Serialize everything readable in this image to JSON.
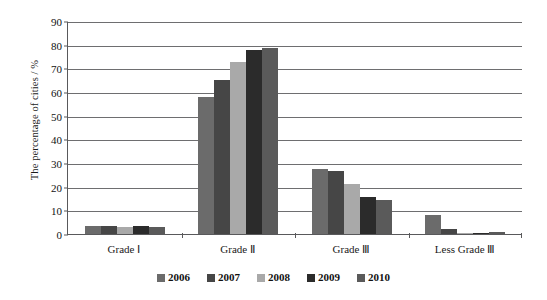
{
  "chart_data": {
    "type": "bar",
    "title": "",
    "subtitle": "",
    "xlabel": "",
    "ylabel": "The percentage of  cities / %",
    "categories": [
      "Grade Ⅰ",
      "Grade Ⅱ",
      "Grade Ⅲ",
      "Less Grade Ⅲ"
    ],
    "ylim": [
      0,
      90
    ],
    "ytick_labels": [
      "0",
      "10",
      "20",
      "30",
      "40",
      "50",
      "60",
      "70",
      "80",
      "90"
    ],
    "yticks": [
      0,
      10,
      20,
      30,
      40,
      50,
      60,
      70,
      80,
      90
    ],
    "grid": true,
    "legend_position": "bottom",
    "series": [
      {
        "name": "2006",
        "color": "#6b6b6b",
        "values": [
          3.5,
          58.0,
          27.5,
          8.0
        ]
      },
      {
        "name": "2007",
        "color": "#464646",
        "values": [
          3.2,
          65.2,
          26.5,
          2.0
        ]
      },
      {
        "name": "2008",
        "color": "#a9a9a9",
        "values": [
          3.0,
          72.5,
          21.0,
          0.3
        ]
      },
      {
        "name": "2009",
        "color": "#2b2b2b",
        "values": [
          3.3,
          77.8,
          15.5,
          0.6
        ]
      },
      {
        "name": "2010",
        "color": "#5a5a5a",
        "values": [
          2.9,
          78.5,
          14.5,
          0.8
        ]
      }
    ]
  },
  "axes": {
    "y_title": "The percentage of  cities / %"
  },
  "legend": {
    "entries": [
      {
        "label": "2006",
        "color": "#6b6b6b"
      },
      {
        "label": "2007",
        "color": "#464646"
      },
      {
        "label": "2008",
        "color": "#a9a9a9"
      },
      {
        "label": "2009",
        "color": "#2b2b2b"
      },
      {
        "label": "2010",
        "color": "#5a5a5a"
      }
    ]
  },
  "colors": {
    "axis": "#59595b",
    "grid": "#6e6e70",
    "background": "#ffffff",
    "text": "#1a1a1a"
  }
}
